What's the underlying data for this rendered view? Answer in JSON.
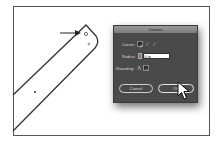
{
  "canvas": {
    "shape": "rounded-bar",
    "annotation": "arrow pointing to corner widget"
  },
  "dialog": {
    "title": "Corners",
    "corner_label": "Corner:",
    "corner_icons": [
      "round-corner-icon",
      "inverted-round-corner-icon",
      "chamfer-corner-icon"
    ],
    "corner_selected": 0,
    "radius_label": "Radius:",
    "radius_value": "0 in",
    "rounding_label": "Rounding:",
    "rounding_icons": [
      "relative-rounding-icon",
      "absolute-rounding-icon"
    ],
    "rounding_selected": 1,
    "cancel_label": "Cancel",
    "ok_label": "OK"
  },
  "colors": {
    "dialog_bg": "#4a4a4a",
    "titlebar": "#8a8a8a",
    "field_bg": "#ffffff"
  }
}
